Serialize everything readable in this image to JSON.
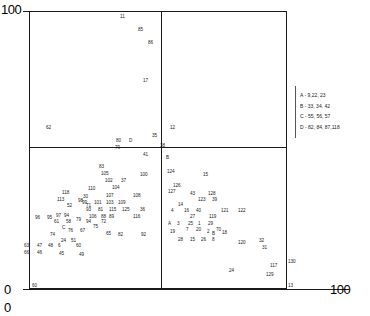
{
  "axes": {
    "top_left_label": "100",
    "bottom_left_label": "0",
    "bottom_left_label_2": "0",
    "bottom_right_label": "100"
  },
  "legend": {
    "entries": [
      "A - 9,22, 23",
      "B - 33, 34, 42",
      "C - 55, 56, 57",
      "D - 82, 84, 87,118"
    ]
  },
  "chart_data": {
    "type": "scatter",
    "title": "",
    "xlabel": "",
    "ylabel": "",
    "xlim": [
      0,
      100
    ],
    "ylim": [
      0,
      100
    ],
    "grid": false,
    "legend_position": "right",
    "quadrant_lines": {
      "vertical_x": 51,
      "horizontal_y": 51
    },
    "note": "Points are rendered as their numeric id labels; A/B/C/D are overplot group markers defined in the legend.",
    "points": [
      {
        "label": "11",
        "x": 120,
        "y": 14
      },
      {
        "label": "85",
        "x": 138,
        "y": 27
      },
      {
        "label": "86",
        "x": 148,
        "y": 40
      },
      {
        "label": "17",
        "x": 143,
        "y": 78
      },
      {
        "label": "62",
        "x": 46,
        "y": 125
      },
      {
        "label": "80",
        "x": 116,
        "y": 138
      },
      {
        "label": "D",
        "x": 129,
        "y": 138
      },
      {
        "label": "35",
        "x": 152,
        "y": 133
      },
      {
        "label": "79",
        "x": 115,
        "y": 145
      },
      {
        "label": "12",
        "x": 170,
        "y": 125
      },
      {
        "label": "38",
        "x": 160,
        "y": 143
      },
      {
        "label": "41",
        "x": 143,
        "y": 152
      },
      {
        "label": "B",
        "x": 166,
        "y": 155
      },
      {
        "label": "100",
        "x": 140,
        "y": 172
      },
      {
        "label": "124",
        "x": 167,
        "y": 169
      },
      {
        "label": "15",
        "x": 203,
        "y": 172
      },
      {
        "label": "83",
        "x": 99,
        "y": 164
      },
      {
        "label": "105",
        "x": 101,
        "y": 171
      },
      {
        "label": "102",
        "x": 105,
        "y": 178
      },
      {
        "label": "37",
        "x": 121,
        "y": 178
      },
      {
        "label": "104",
        "x": 112,
        "y": 185
      },
      {
        "label": "118",
        "x": 62,
        "y": 190
      },
      {
        "label": "110",
        "x": 88,
        "y": 186
      },
      {
        "label": "126",
        "x": 173,
        "y": 183
      },
      {
        "label": "127",
        "x": 168,
        "y": 189
      },
      {
        "label": "113",
        "x": 57,
        "y": 197
      },
      {
        "label": "30",
        "x": 83,
        "y": 194
      },
      {
        "label": "98",
        "x": 78,
        "y": 198
      },
      {
        "label": "107",
        "x": 106,
        "y": 193
      },
      {
        "label": "108",
        "x": 133,
        "y": 193
      },
      {
        "label": "43",
        "x": 190,
        "y": 191
      },
      {
        "label": "128",
        "x": 208,
        "y": 191
      },
      {
        "label": "52",
        "x": 67,
        "y": 203
      },
      {
        "label": "71",
        "x": 86,
        "y": 203
      },
      {
        "label": "99",
        "x": 82,
        "y": 200
      },
      {
        "label": "101",
        "x": 94,
        "y": 200
      },
      {
        "label": "103",
        "x": 106,
        "y": 200
      },
      {
        "label": "109",
        "x": 118,
        "y": 200
      },
      {
        "label": "123",
        "x": 198,
        "y": 197
      },
      {
        "label": "39",
        "x": 212,
        "y": 197
      },
      {
        "label": "93",
        "x": 86,
        "y": 207
      },
      {
        "label": "81",
        "x": 98,
        "y": 207
      },
      {
        "label": "115",
        "x": 109,
        "y": 207
      },
      {
        "label": "125",
        "x": 122,
        "y": 207
      },
      {
        "label": "36",
        "x": 140,
        "y": 207
      },
      {
        "label": "14",
        "x": 178,
        "y": 202
      },
      {
        "label": "4",
        "x": 171,
        "y": 208
      },
      {
        "label": "16",
        "x": 184,
        "y": 208
      },
      {
        "label": "40",
        "x": 196,
        "y": 208
      },
      {
        "label": "121",
        "x": 221,
        "y": 208
      },
      {
        "label": "122",
        "x": 238,
        "y": 208
      },
      {
        "label": "96",
        "x": 35,
        "y": 215
      },
      {
        "label": "95",
        "x": 47,
        "y": 215
      },
      {
        "label": "97",
        "x": 56,
        "y": 213
      },
      {
        "label": "94",
        "x": 64,
        "y": 213
      },
      {
        "label": "106",
        "x": 89,
        "y": 214
      },
      {
        "label": "88",
        "x": 101,
        "y": 214
      },
      {
        "label": "89",
        "x": 109,
        "y": 214
      },
      {
        "label": "116",
        "x": 133,
        "y": 214
      },
      {
        "label": "27",
        "x": 190,
        "y": 214
      },
      {
        "label": "119",
        "x": 209,
        "y": 214
      },
      {
        "label": "61",
        "x": 54,
        "y": 219
      },
      {
        "label": "58",
        "x": 66,
        "y": 219
      },
      {
        "label": "79b",
        "text": "79",
        "x": 76,
        "y": 217
      },
      {
        "label": "94b",
        "text": "94",
        "x": 86,
        "y": 219
      },
      {
        "label": "72",
        "x": 101,
        "y": 219
      },
      {
        "label": "A",
        "x": 168,
        "y": 221
      },
      {
        "label": "3",
        "x": 177,
        "y": 221
      },
      {
        "label": "25",
        "x": 188,
        "y": 221
      },
      {
        "label": "1",
        "x": 198,
        "y": 221
      },
      {
        "label": "29",
        "x": 208,
        "y": 221
      },
      {
        "label": "C",
        "x": 62,
        "y": 225
      },
      {
        "label": "76",
        "x": 68,
        "y": 228
      },
      {
        "label": "67",
        "x": 80,
        "y": 228
      },
      {
        "label": "75",
        "x": 93,
        "y": 224
      },
      {
        "label": "19",
        "x": 170,
        "y": 229
      },
      {
        "label": "7",
        "x": 186,
        "y": 227
      },
      {
        "label": "20",
        "x": 196,
        "y": 227
      },
      {
        "label": "2",
        "x": 207,
        "y": 229
      },
      {
        "label": "B2",
        "text": "B",
        "x": 212,
        "y": 231
      },
      {
        "label": "70",
        "x": 216,
        "y": 227
      },
      {
        "label": "18",
        "x": 222,
        "y": 230
      },
      {
        "label": "74",
        "x": 50,
        "y": 232
      },
      {
        "label": "65",
        "x": 106,
        "y": 231
      },
      {
        "label": "82",
        "x": 118,
        "y": 232
      },
      {
        "label": "92",
        "x": 141,
        "y": 232
      },
      {
        "label": "24",
        "x": 61,
        "y": 238
      },
      {
        "label": "51",
        "x": 71,
        "y": 238
      },
      {
        "label": "28",
        "x": 178,
        "y": 237
      },
      {
        "label": "15b",
        "text": "15",
        "x": 190,
        "y": 237
      },
      {
        "label": "26",
        "x": 201,
        "y": 237
      },
      {
        "label": "8",
        "x": 212,
        "y": 237
      },
      {
        "label": "120",
        "x": 238,
        "y": 240
      },
      {
        "label": "32",
        "x": 259,
        "y": 238
      },
      {
        "label": "31",
        "x": 262,
        "y": 245
      },
      {
        "label": "63",
        "x": 24,
        "y": 243
      },
      {
        "label": "47",
        "x": 37,
        "y": 243
      },
      {
        "label": "48",
        "x": 48,
        "y": 243
      },
      {
        "label": "6",
        "x": 58,
        "y": 243
      },
      {
        "label": "60",
        "x": 76,
        "y": 243
      },
      {
        "label": "66",
        "x": 24,
        "y": 250
      },
      {
        "label": "46",
        "x": 37,
        "y": 250
      },
      {
        "label": "45",
        "x": 59,
        "y": 251
      },
      {
        "label": "49",
        "x": 79,
        "y": 252
      },
      {
        "label": "24b",
        "text": "24",
        "x": 229,
        "y": 268
      },
      {
        "label": "117",
        "x": 270,
        "y": 263
      },
      {
        "label": "130",
        "x": 288,
        "y": 259
      },
      {
        "label": "129",
        "x": 266,
        "y": 272
      },
      {
        "label": "60b",
        "text": "60",
        "x": 32,
        "y": 283
      },
      {
        "label": "13",
        "x": 288,
        "y": 283
      }
    ]
  }
}
